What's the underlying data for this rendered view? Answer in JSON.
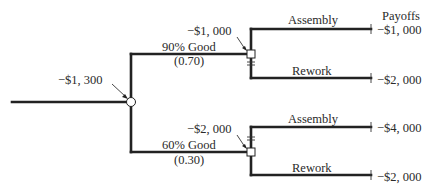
{
  "diagram": {
    "type": "decision-tree",
    "payoffs_header": "Payoffs",
    "root": {
      "value_label": "−$1, 300",
      "node_type": "chance"
    },
    "branches": [
      {
        "label": "90% Good",
        "probability_label": "(0.70)",
        "decision_value_label": "−$1, 000",
        "node_type": "decision",
        "options": [
          {
            "label": "Assembly",
            "payoff": "−$1, 000",
            "chosen": true
          },
          {
            "label": "Rework",
            "payoff": "−$2, 000",
            "chosen": false
          }
        ]
      },
      {
        "label": "60% Good",
        "probability_label": "(0.30)",
        "decision_value_label": "−$2, 000",
        "node_type": "decision",
        "options": [
          {
            "label": "Assembly",
            "payoff": "−$4, 000",
            "chosen": false
          },
          {
            "label": "Rework",
            "payoff": "−$2, 000",
            "chosen": true
          }
        ]
      }
    ],
    "colors": {
      "line": "#222222",
      "text": "#2a2a2a",
      "background": "#ffffff"
    }
  }
}
